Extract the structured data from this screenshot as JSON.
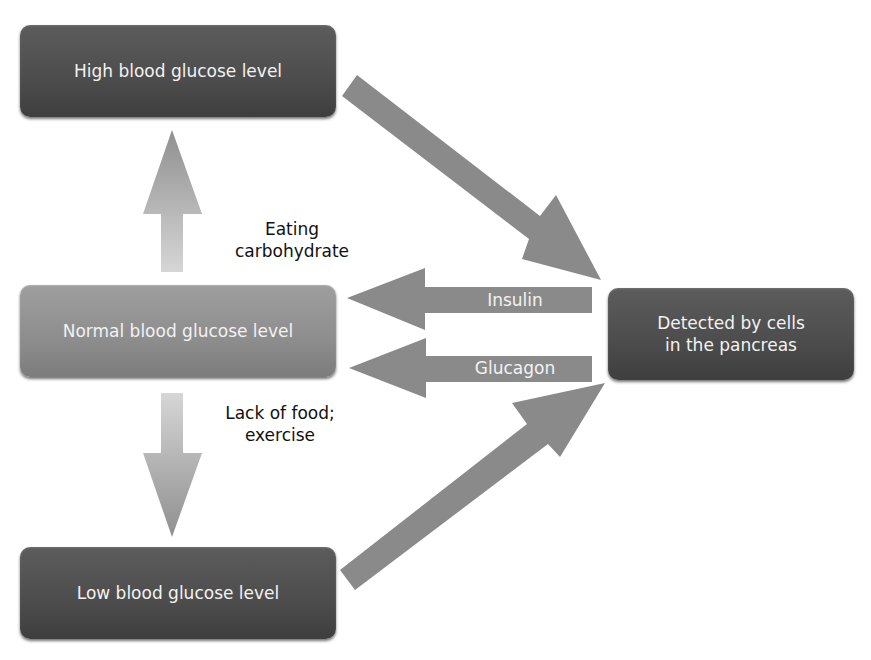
{
  "diagram": {
    "nodes": {
      "high": {
        "label": "High blood glucose level"
      },
      "normal": {
        "label": "Normal blood glucose level"
      },
      "low": {
        "label": "Low blood glucose level"
      },
      "pancreas": {
        "label_line1": "Detected by cells",
        "label_line2": "in the pancreas"
      }
    },
    "edges": {
      "eating": {
        "label_line1": "Eating",
        "label_line2": "carbohydrate"
      },
      "lack": {
        "label_line1": "Lack of food;",
        "label_line2": "exercise"
      },
      "insulin": {
        "label": "Insulin"
      },
      "glucagon": {
        "label": "Glucagon"
      }
    },
    "colors": {
      "dark_box": "#4c4c4c",
      "normal_box": "#8d8d8d",
      "arrow": "#8a8a8a",
      "text_light": "#f2f2f2",
      "text_dark": "#111111"
    }
  }
}
